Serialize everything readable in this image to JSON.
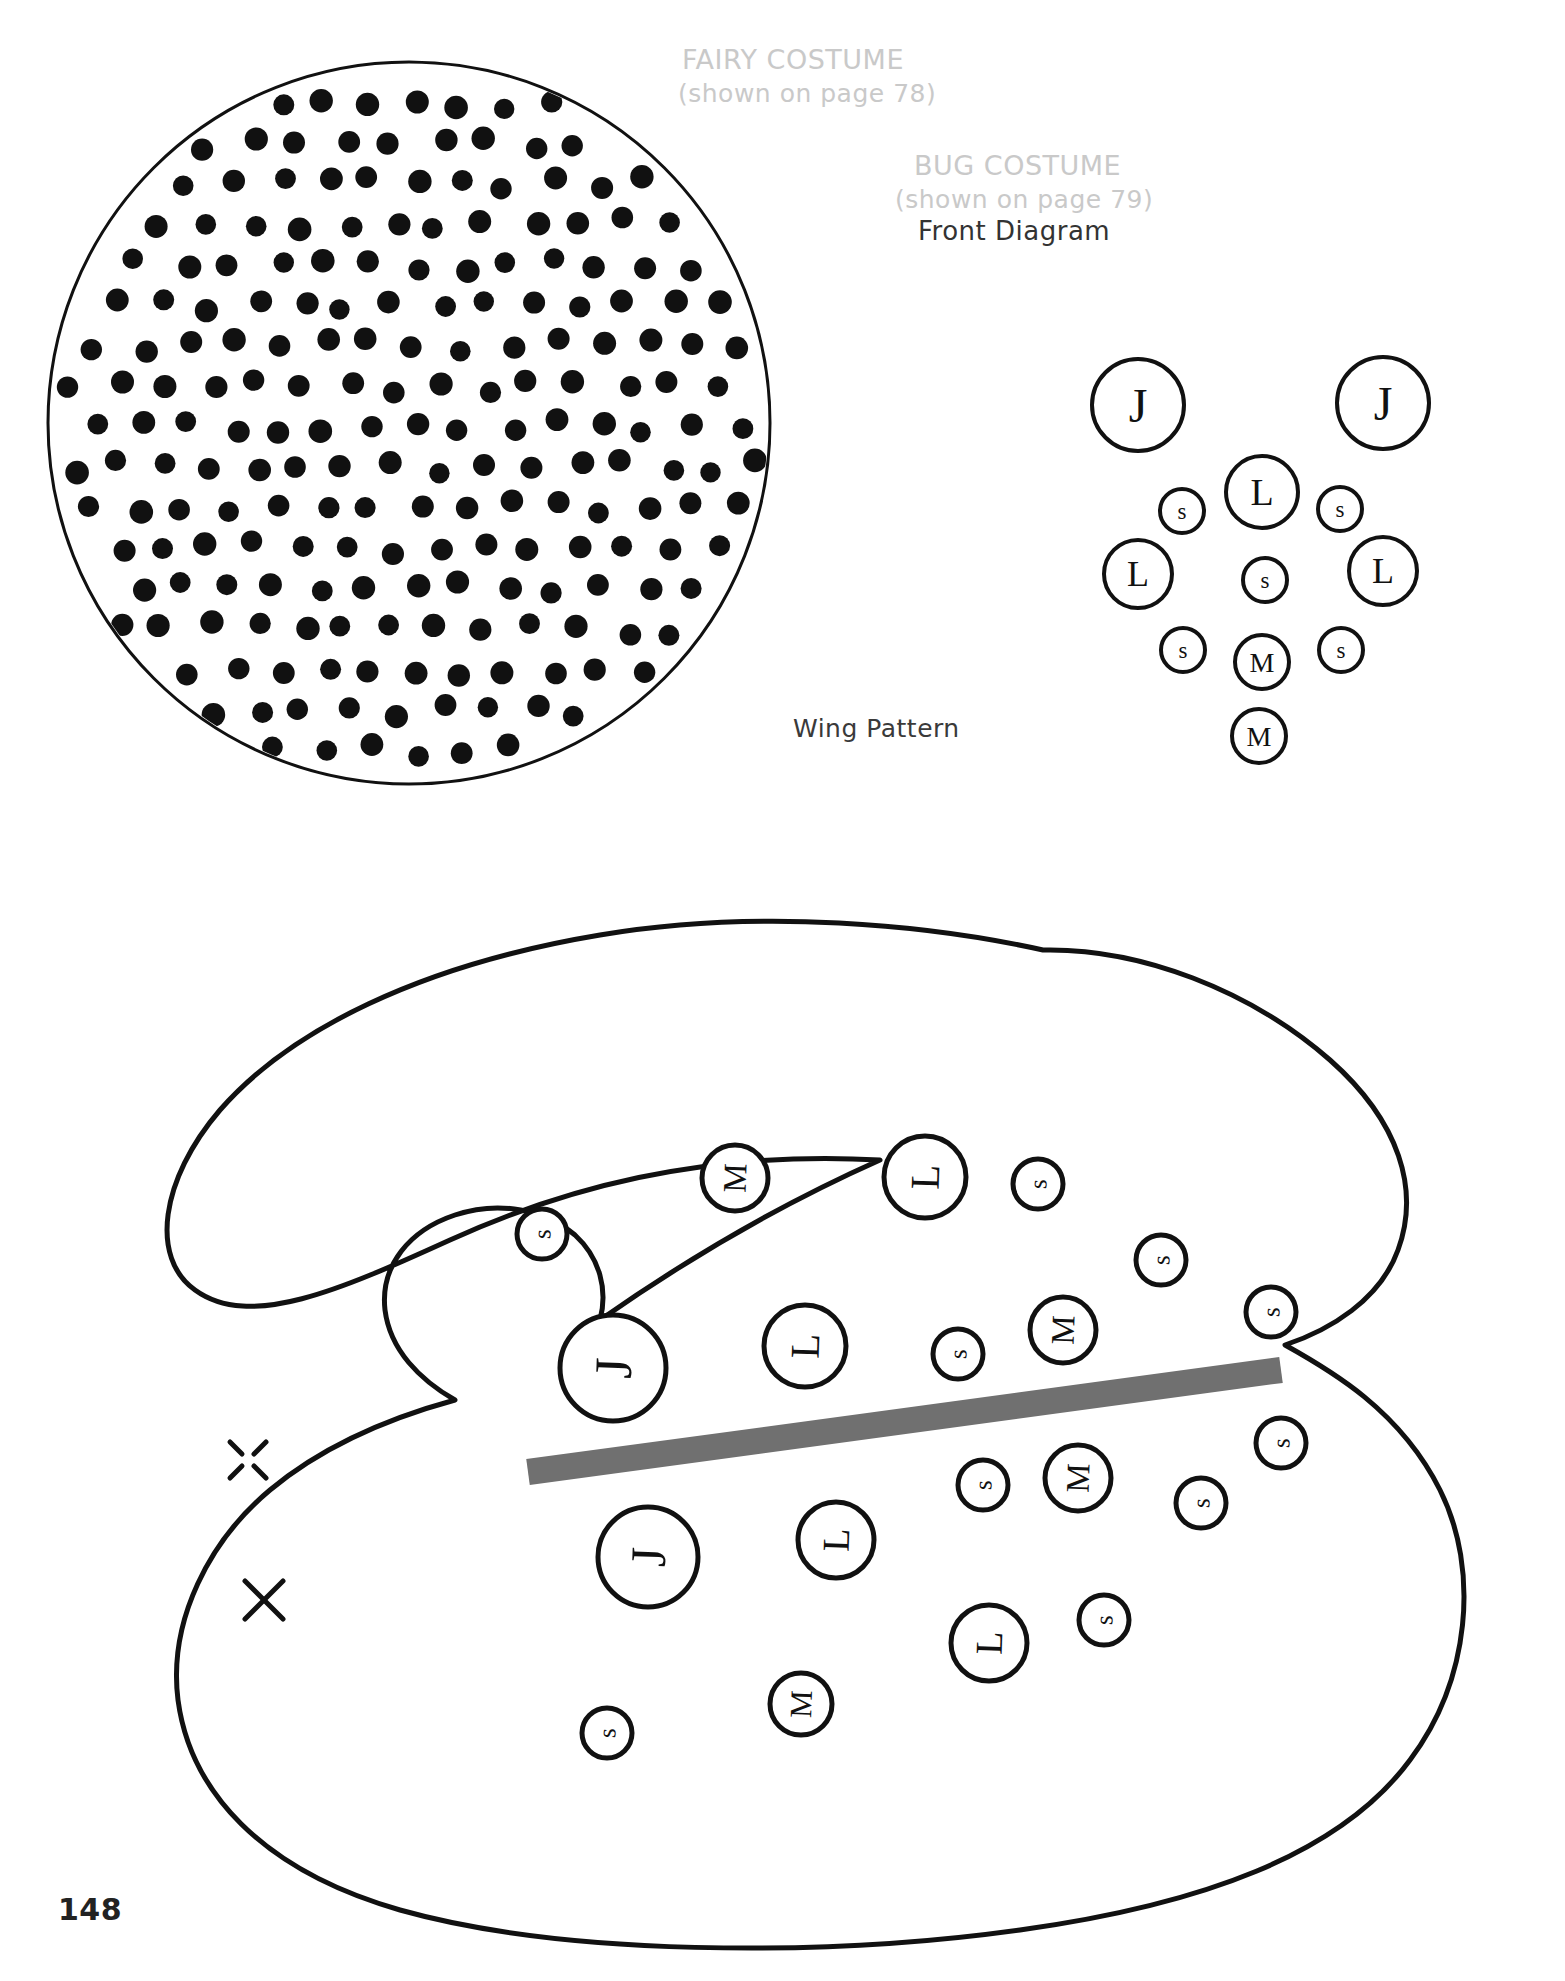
{
  "page": {
    "number": "148",
    "background_color": "#ffffff",
    "ink_color": "#111111",
    "muted_color": "#c9c9c9",
    "gray_bar_color": "#707070"
  },
  "headings": {
    "fairy_title": "FAIRY COSTUME",
    "fairy_subtitle": "(shown on page 78)",
    "bug_title": "BUG COSTUME",
    "bug_subtitle": "(shown on page 79)",
    "front_diagram": "Front Diagram",
    "wing_pattern": "Wing Pattern"
  },
  "fairy_pattern": {
    "name": "polka-dot-circle",
    "shape": "circle",
    "center": [
      409,
      423
    ],
    "radius": 361,
    "dot_radius": 11,
    "dot_spacing": 46,
    "dot_color": "#111111",
    "outline_color": "#111111",
    "outline_width": 3
  },
  "front_diagram_circles": [
    {
      "label": "J",
      "cx": 1138,
      "cy": 405,
      "r": 46
    },
    {
      "label": "J",
      "cx": 1383,
      "cy": 403,
      "r": 46
    },
    {
      "label": "s",
      "cx": 1182,
      "cy": 511,
      "r": 22
    },
    {
      "label": "L",
      "cx": 1262,
      "cy": 492,
      "r": 36
    },
    {
      "label": "s",
      "cx": 1340,
      "cy": 509,
      "r": 22
    },
    {
      "label": "L",
      "cx": 1138,
      "cy": 574,
      "r": 34
    },
    {
      "label": "s",
      "cx": 1265,
      "cy": 580,
      "r": 22
    },
    {
      "label": "L",
      "cx": 1383,
      "cy": 571,
      "r": 34
    },
    {
      "label": "s",
      "cx": 1183,
      "cy": 650,
      "r": 22
    },
    {
      "label": "M",
      "cx": 1262,
      "cy": 662,
      "r": 27
    },
    {
      "label": "s",
      "cx": 1341,
      "cy": 650,
      "r": 22
    },
    {
      "label": "M",
      "cx": 1259,
      "cy": 736,
      "r": 27
    }
  ],
  "wing_pattern_circles": [
    {
      "label": "s",
      "cx": 542,
      "cy": 1234,
      "r": 25,
      "rot": -88
    },
    {
      "label": "M",
      "cx": 735,
      "cy": 1178,
      "r": 33,
      "rot": -88
    },
    {
      "label": "L",
      "cx": 925,
      "cy": 1177,
      "r": 41,
      "rot": -88
    },
    {
      "label": "s",
      "cx": 1038,
      "cy": 1184,
      "r": 25,
      "rot": -88
    },
    {
      "label": "s",
      "cx": 1161,
      "cy": 1260,
      "r": 25,
      "rot": -88
    },
    {
      "label": "J",
      "cx": 613,
      "cy": 1368,
      "r": 53,
      "rot": -88
    },
    {
      "label": "L",
      "cx": 805,
      "cy": 1346,
      "r": 41,
      "rot": -88
    },
    {
      "label": "s",
      "cx": 958,
      "cy": 1354,
      "r": 25,
      "rot": -88
    },
    {
      "label": "M",
      "cx": 1063,
      "cy": 1330,
      "r": 33,
      "rot": -88
    },
    {
      "label": "s",
      "cx": 1271,
      "cy": 1312,
      "r": 25,
      "rot": -88
    },
    {
      "label": "s",
      "cx": 1281,
      "cy": 1443,
      "r": 25,
      "rot": -88
    },
    {
      "label": "s",
      "cx": 983,
      "cy": 1485,
      "r": 25,
      "rot": -88
    },
    {
      "label": "M",
      "cx": 1078,
      "cy": 1478,
      "r": 33,
      "rot": -88
    },
    {
      "label": "s",
      "cx": 1201,
      "cy": 1503,
      "r": 25,
      "rot": -88
    },
    {
      "label": "J",
      "cx": 648,
      "cy": 1557,
      "r": 50,
      "rot": -88
    },
    {
      "label": "L",
      "cx": 836,
      "cy": 1540,
      "r": 38,
      "rot": -88
    },
    {
      "label": "L",
      "cx": 989,
      "cy": 1643,
      "r": 38,
      "rot": -88
    },
    {
      "label": "s",
      "cx": 1104,
      "cy": 1620,
      "r": 25,
      "rot": -88
    },
    {
      "label": "M",
      "cx": 801,
      "cy": 1704,
      "r": 31,
      "rot": -88
    },
    {
      "label": "s",
      "cx": 607,
      "cy": 1733,
      "r": 25,
      "rot": -88
    }
  ],
  "wing_marks": [
    {
      "name": "dashed-x-mark",
      "cx": 248,
      "cy": 1460,
      "size": 36,
      "style": "dashed"
    },
    {
      "name": "solid-x-mark",
      "cx": 264,
      "cy": 1600,
      "size": 38,
      "style": "solid"
    }
  ],
  "gray_bar": {
    "name": "fold-line",
    "x1": 528,
    "y1": 1472,
    "x2": 1281,
    "y2": 1370,
    "thickness": 26,
    "color": "#707070"
  }
}
